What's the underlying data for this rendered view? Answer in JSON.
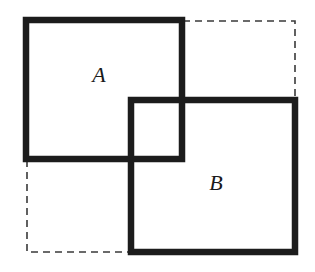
{
  "diagram": {
    "type": "overlapping-rectangles",
    "colors": {
      "solid_stroke": "#1c1c1c",
      "dashed_stroke": "#3a3a3a",
      "background": "#ffffff"
    },
    "dashed_bounding_box": {
      "x": 27,
      "y": 21,
      "width": 268,
      "height": 231
    },
    "rect_a": {
      "label": "A",
      "x": 26,
      "y": 20,
      "width": 156,
      "height": 139,
      "label_x": 99,
      "label_y": 75
    },
    "rect_b": {
      "label": "B",
      "x": 131,
      "y": 100,
      "width": 164,
      "height": 152,
      "label_x": 216,
      "label_y": 183
    }
  }
}
